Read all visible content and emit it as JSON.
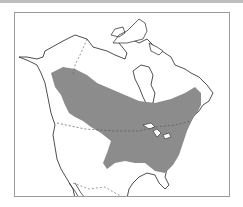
{
  "map": {
    "title": "",
    "region": "North America",
    "range_label": "Species range",
    "colors": {
      "range_fill": "#8c8c8c",
      "land_fill": "#ffffff",
      "coastline": "#222222",
      "border": "#555555",
      "frame": "#9a9a9a"
    },
    "legend": []
  }
}
